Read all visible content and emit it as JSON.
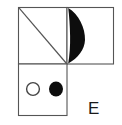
{
  "figure": {
    "background_color": "#ffffff",
    "line_color": "#555555",
    "fill_color": "#0d0d0d",
    "label": "E",
    "panels": [
      {
        "name": "top-left-panel",
        "x": 18,
        "y": 7,
        "width": 49,
        "height": 57,
        "content": "diagonal-line",
        "diagonal": "top-left-to-bottom-right"
      },
      {
        "name": "top-right-panel",
        "x": 67,
        "y": 7,
        "width": 47,
        "height": 57,
        "content": "black-lens-crescent",
        "lens_side": "left-edge"
      },
      {
        "name": "bottom-left-panel",
        "x": 18,
        "y": 64,
        "width": 49,
        "height": 52,
        "content": "two-circles",
        "circles": [
          {
            "name": "hollow-circle",
            "cx": 33,
            "cy": 89,
            "r": 6.5,
            "fill": "none"
          },
          {
            "name": "filled-circle",
            "cx": 56,
            "cy": 89,
            "r": 7.0,
            "fill": "#0d0d0d"
          }
        ]
      }
    ],
    "annotation": {
      "text": "E",
      "x": 88,
      "y": 114
    }
  }
}
